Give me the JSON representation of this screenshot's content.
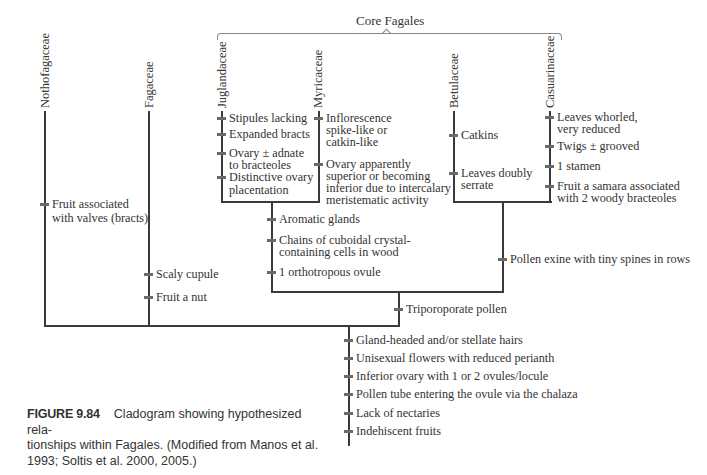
{
  "bracket_label": "Core Fagales",
  "taxa": {
    "nothofagaceae": "Nothofagaceae",
    "fagaceae": "Fagaceae",
    "juglandaceae": "Juglandaceae",
    "myricaceae": "Myricaceae",
    "betulaceae": "Betulaceae",
    "casuarinaceae": "Casuarinaceae"
  },
  "characters": {
    "nothofagaceae": [
      "Fruit associated",
      "with valves (bracts)"
    ],
    "fagaceae": [
      "Scaly cupule",
      "Fruit a nut"
    ],
    "juglandaceae": [
      "Stipules lacking",
      "Expanded bracts",
      "Ovary ± adnate",
      "to bracteoles",
      "Distinctive ovary",
      "placentation"
    ],
    "myricaceae": [
      "Inflorescence",
      "spike-like or",
      "catkin-like",
      "Ovary apparently",
      "superior or becoming",
      "inferior due to intercalary",
      "meristematic activity"
    ],
    "betulaceae": [
      "Catkins",
      "Leaves doubly",
      "serrate"
    ],
    "casuarinaceae": [
      "Leaves whorled,",
      "very reduced",
      "Twigs ± grooved",
      "1 stamen",
      "Fruit a samara associated",
      "with 2 woody bracteoles"
    ],
    "jug_myr_clade": [
      "Aromatic glands",
      "Chains of cuboidal crystal-",
      "containing cells in wood",
      "1 orthotropous ovule"
    ],
    "bet_cas_clade": [
      "Pollen exine with tiny spines in rows"
    ],
    "core_fagales": [
      "Triporoporate pollen"
    ],
    "fagales_root": [
      "Gland-headed and/or stellate hairs",
      "Unisexual flowers with reduced perianth",
      "Inferior ovary with 1 or 2 ovules/locule",
      "Pollen tube entering the ovule via the chalaza",
      "Lack of nectaries",
      "Indehiscent fruits"
    ]
  },
  "caption": {
    "figure_number": "FIGURE 9.84",
    "line1": "Cladogram showing hypothesized rela-",
    "line2": "tionships within Fagales. (Modified from Manos et al.",
    "line3": "1993; Soltis et al. 2000, 2005.)"
  }
}
